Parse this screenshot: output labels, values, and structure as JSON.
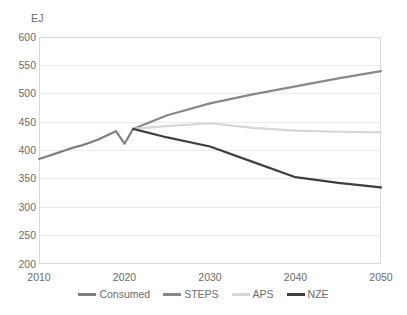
{
  "chart_data": {
    "type": "line",
    "title": "",
    "subtitle": "",
    "xlabel": "",
    "ylabel": "EJ",
    "unit_label": "EJ",
    "xlim": [
      2010,
      2050
    ],
    "ylim": [
      200,
      600
    ],
    "ytick_step": 50,
    "xtick_step": 10,
    "yticks": [
      600,
      550,
      500,
      450,
      400,
      350,
      300,
      250,
      200
    ],
    "xticks": [
      2010,
      2020,
      2030,
      2040,
      2050
    ],
    "grid": "horizontal",
    "legend_position": "bottom-center",
    "series": [
      {
        "name": "Consumed",
        "color": "#7f7f7f",
        "x": [
          2010,
          2011,
          2012,
          2013,
          2014,
          2015,
          2016,
          2017,
          2018,
          2019,
          2020,
          2021
        ],
        "values": [
          385,
          390,
          395,
          400,
          405,
          409,
          414,
          420,
          427,
          434,
          412,
          438
        ]
      },
      {
        "name": "STEPS",
        "color": "#888888",
        "x": [
          2021,
          2025,
          2030,
          2035,
          2040,
          2045,
          2050
        ],
        "values": [
          438,
          462,
          483,
          499,
          513,
          527,
          540
        ]
      },
      {
        "name": "APS",
        "color": "#d6d6d6",
        "x": [
          2021,
          2025,
          2030,
          2035,
          2040,
          2045,
          2050
        ],
        "values": [
          438,
          443,
          448,
          440,
          435,
          433,
          432
        ]
      },
      {
        "name": "NZE",
        "color": "#3f3f3f",
        "x": [
          2021,
          2025,
          2030,
          2035,
          2040,
          2045,
          2050
        ],
        "values": [
          438,
          423,
          407,
          380,
          353,
          343,
          335
        ]
      }
    ],
    "legend": [
      {
        "label": "Consumed",
        "color": "#7f7f7f"
      },
      {
        "label": "STEPS",
        "color": "#888888"
      },
      {
        "label": "APS",
        "color": "#d6d6d6"
      },
      {
        "label": "NZE",
        "color": "#3f3f3f"
      }
    ],
    "axis_colors": {
      "grid": "#eaeaea",
      "border": "#d9d9d9",
      "text": "#6b6b6b"
    },
    "plot_area": {
      "left": 39,
      "top": 37,
      "right": 381,
      "bottom": 264
    }
  }
}
